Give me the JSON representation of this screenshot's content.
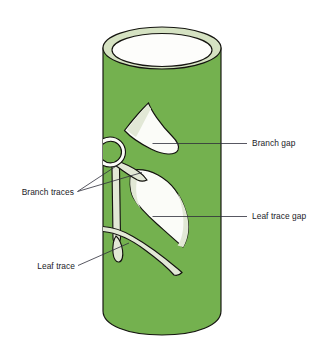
{
  "figure": {
    "background_color": "#ffffff"
  },
  "colors": {
    "stem_green": "#74b14f",
    "stem_green_dark_edge": "#6aa447",
    "rim_pale_green": "#d5e2c2",
    "rim_inner_white": "#fdfdfb",
    "gap_white": "#fbfcf8",
    "trace_pale": "#e2e8d6",
    "outline_dark": "#14140f",
    "outline_mid": "#3a3a30",
    "text_color": "#1b1b28",
    "leader_color": "#2d2d3a"
  },
  "labels": [
    {
      "id": "branch-gap",
      "text": "Branch gap",
      "text_x": 252,
      "text_y": 146,
      "anchor": "start",
      "leader": "M152.5,143.5 L247,143.5"
    },
    {
      "id": "leaf-trace-gap",
      "text": "Leaf trace gap",
      "text_x": 252,
      "text_y": 219,
      "anchor": "start",
      "leader": "M152.5,216.5 L247,216.5"
    },
    {
      "id": "branch-traces",
      "text": "Branch traces",
      "text_x": 74,
      "text_y": 195,
      "anchor": "end",
      "leader": "M77.5,191.5 L142,172.5 M77.5,191.5 L117,165.5"
    },
    {
      "id": "leaf-trace",
      "text": "Leaf trace",
      "text_x": 75,
      "text_y": 269,
      "anchor": "end",
      "leader": "M78,265.5 L129,243"
    }
  ],
  "parts": [
    {
      "id": "stem-cylinder",
      "name": "stem cylinder"
    },
    {
      "id": "stem-top-rim",
      "name": "cut top rim of stem"
    },
    {
      "id": "stem-hollow",
      "name": "hollow pith / inner face"
    },
    {
      "id": "branch-gap-shape",
      "name": "branch gap"
    },
    {
      "id": "leaf-trace-gap-shape",
      "name": "leaf trace gap"
    },
    {
      "id": "branch-ring",
      "name": "branch attachment ring"
    },
    {
      "id": "branch-trace-strap",
      "name": "branch trace vascular strand"
    },
    {
      "id": "leaf-trace-strap",
      "name": "leaf trace vascular strand"
    },
    {
      "id": "leaf-trace-droplet",
      "name": "leaf trace terminal"
    }
  ]
}
